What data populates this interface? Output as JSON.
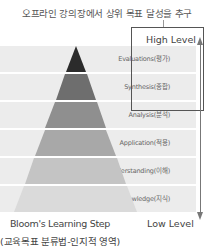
{
  "header": {
    "caption": "오프라인 강의장에서 상위 목표 달성을 추구"
  },
  "axis": {
    "high_label": "High Level",
    "low_label": "Low Level"
  },
  "levels": [
    {
      "label": "Evaluations(평가)",
      "color": "#2b2b2b"
    },
    {
      "label": "Synthesis(종합)",
      "color": "#6e6e6e"
    },
    {
      "label": "Analysis(분석)",
      "color": "#8f8f8f"
    },
    {
      "label": "Application(적용)",
      "color": "#a8a8a8"
    },
    {
      "label": "Understanding(이해)",
      "color": "#c8c8c8"
    },
    {
      "label": "Knowledge(지식)",
      "color": "#dcdcdc"
    }
  ],
  "footer": {
    "title": "Bloom's Learning Step",
    "subtitle": "(교육목표 분류법-인지적 영역)"
  }
}
